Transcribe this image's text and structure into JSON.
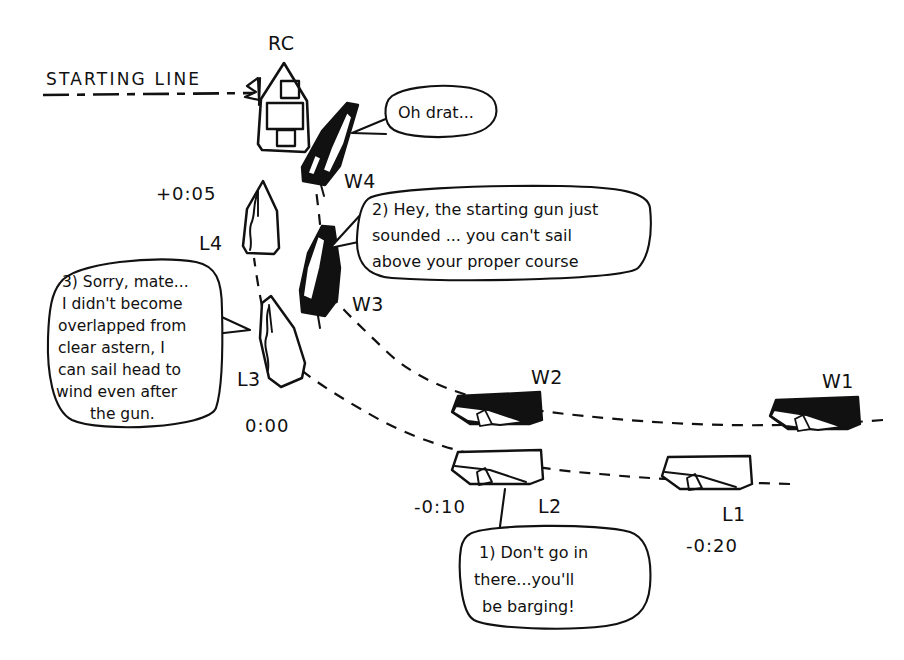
{
  "canvas": {
    "width": 904,
    "height": 660,
    "background": "#ffffff",
    "ink": "#111111"
  },
  "labels": {
    "starting_line": "STARTING LINE",
    "rc": "RC"
  },
  "boats": [
    {
      "id": "RC",
      "label": "RC",
      "kind": "committee-boat",
      "fill": "white",
      "time": null,
      "x": 283,
      "y": 110
    },
    {
      "id": "W4",
      "label": "W4",
      "kind": "windward",
      "fill": "black",
      "time": null,
      "x": 322,
      "y": 155
    },
    {
      "id": "W3",
      "label": "W3",
      "kind": "windward",
      "fill": "black",
      "time": null,
      "x": 316,
      "y": 275
    },
    {
      "id": "W2",
      "label": "W2",
      "kind": "windward",
      "fill": "black",
      "time": null,
      "x": 500,
      "y": 410
    },
    {
      "id": "W1",
      "label": "W1",
      "kind": "windward",
      "fill": "black",
      "time": null,
      "x": 815,
      "y": 415
    },
    {
      "id": "L4",
      "label": "L4",
      "kind": "leeward",
      "fill": "white",
      "time": "+0:05",
      "x": 262,
      "y": 220
    },
    {
      "id": "L3",
      "label": "L3",
      "kind": "leeward",
      "fill": "white",
      "time": "0:00",
      "x": 279,
      "y": 340
    },
    {
      "id": "L2",
      "label": "L2",
      "kind": "leeward",
      "fill": "white",
      "time": "-0:10",
      "x": 500,
      "y": 470
    },
    {
      "id": "L1",
      "label": "L1",
      "kind": "leeward",
      "fill": "white",
      "time": "-0:20",
      "x": 707,
      "y": 480
    }
  ],
  "times": [
    {
      "value": "+0:05",
      "for": "L4"
    },
    {
      "value": "0:00",
      "for": "L3"
    },
    {
      "value": "-0:10",
      "for": "L2"
    },
    {
      "value": "-0:20",
      "for": "L1"
    }
  ],
  "bubbles": [
    {
      "id": "bubble-1",
      "speaker": "L2",
      "number": "1)",
      "lines": [
        "1) Don't go in",
        "there...you'll",
        "be barging!"
      ]
    },
    {
      "id": "bubble-2",
      "speaker": "W3",
      "number": "2)",
      "lines": [
        "2) Hey, the starting gun just",
        "sounded ... you can't sail",
        "above your proper course"
      ]
    },
    {
      "id": "bubble-3",
      "speaker": "L3",
      "number": "3)",
      "lines": [
        "3) Sorry, mate...",
        "I didn't become",
        "overlapped from",
        "clear astern, I",
        "can sail head to",
        "wind even after",
        "the gun."
      ]
    },
    {
      "id": "bubble-4",
      "speaker": "W4",
      "number": null,
      "lines": [
        "Oh drat..."
      ]
    }
  ]
}
